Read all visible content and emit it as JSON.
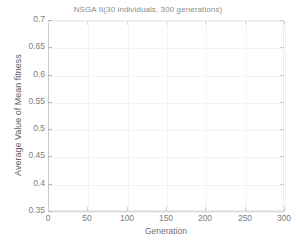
{
  "chart_data": {
    "type": "line",
    "title": "NSGA II(30 individuals, 300 generations)",
    "xlabel": "Generation",
    "ylabel": "Average Value of Mean fitness",
    "xlim": [
      0,
      300
    ],
    "ylim": [
      0.35,
      0.7
    ],
    "xticks": [
      0,
      50,
      100,
      150,
      200,
      250,
      300
    ],
    "xtick_labels": [
      "0",
      "50",
      "100",
      "150",
      "200",
      "250",
      "300"
    ],
    "yticks": [
      0.35,
      0.4,
      0.45,
      0.5,
      0.55,
      0.6,
      0.65,
      0.7
    ],
    "ytick_labels": [
      "0.35",
      "0.4",
      "0.45",
      "0.5",
      "0.55",
      "0.6",
      "0.65",
      "0.7"
    ],
    "grid": true,
    "legend": null,
    "series": [
      {
        "name": "Average Value of Mean fitness",
        "x": [],
        "values": []
      }
    ],
    "annotations": []
  },
  "style": {
    "background": "#ffffff",
    "axis_color": "#c9c9cc",
    "grid_color": "#f2f2f5",
    "tick_color": "#cfcfd3",
    "text_color": "#7e7e82",
    "title_color": "#8d8d8d"
  }
}
